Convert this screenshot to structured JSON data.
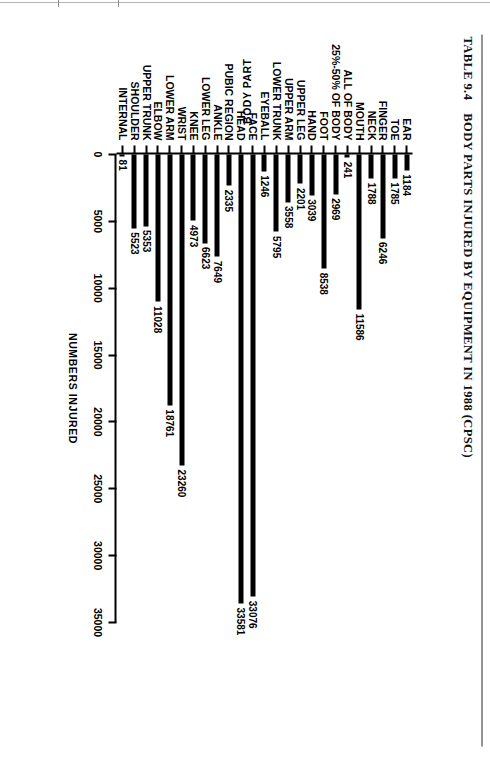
{
  "title": {
    "number": "TABLE 9.4",
    "text": "BODY PARTS INJURED BY EQUIPMENT IN 1988 (CPSC)"
  },
  "chart_data": {
    "type": "bar",
    "orientation": "horizontal",
    "xlabel": "NUMBERS INJURED",
    "ylabel": "BODY PART",
    "xlim": [
      0,
      35000
    ],
    "xticks": [
      0,
      5000,
      10000,
      15000,
      20000,
      25000,
      30000,
      35000
    ],
    "xticklabels": [
      "0",
      "5000",
      "10000",
      "15000",
      "20000",
      "25000",
      "30000",
      "35000"
    ],
    "grid": false,
    "legend": "none",
    "bar_color": "#000000",
    "categories": [
      "EAR",
      "TOE",
      "FINGER",
      "NECK",
      "MOUTH",
      "ALL OF BODY",
      "25%-50% OF BODY",
      "FOOT",
      "HAND",
      "UPPER LEG",
      "UPPER ARM",
      "LOWER TRUNK",
      "EYEBALL",
      "FACE",
      "HEAD",
      "PUBIC REGION",
      "ANKLE",
      "LOWER LEG",
      "KNEE",
      "WRIST",
      "LOWER ARM",
      "ELBOW",
      "UPPER TRUNK",
      "SHOULDER",
      "INTERNAL"
    ],
    "values": [
      1184,
      1785,
      6246,
      1788,
      11586,
      241,
      2969,
      8538,
      3039,
      2201,
      3558,
      5795,
      1246,
      33076,
      33581,
      2335,
      7649,
      6623,
      4973,
      23260,
      18761,
      11028,
      5353,
      5523,
      81
    ],
    "value_labels": [
      "1184",
      "1785",
      "6246",
      "1788",
      "11586",
      "241",
      "2969",
      "8538",
      "3039",
      "2201",
      "3558",
      "5795",
      "1246",
      "33076",
      "33581",
      "2335",
      "7649",
      "6623",
      "4973",
      "23260",
      "18761",
      "11028",
      "5353",
      "5523",
      "81"
    ]
  }
}
